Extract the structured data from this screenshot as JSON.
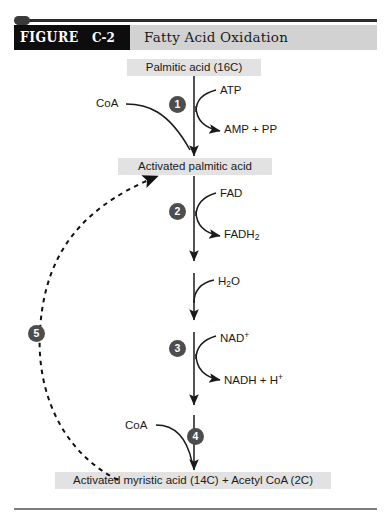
{
  "header": {
    "figure_word": "FIGURE",
    "figure_number": "C-2",
    "title": "Fatty Acid Oxidation"
  },
  "pathway": {
    "boxes": [
      {
        "id": "palmitic",
        "label": "Palmitic acid (16C)"
      },
      {
        "id": "activated",
        "label": "Activated palmitic acid"
      },
      {
        "id": "myristic",
        "label": "Activated myristic acid (14C) + Acetyl CoA (2C)"
      }
    ],
    "steps": [
      {
        "number": "1",
        "substrate": "CoA",
        "cosubstrate": "ATP",
        "product": "AMP + PP"
      },
      {
        "number": "2",
        "substrate": "",
        "cosubstrate": "FAD",
        "product": "FADH2"
      },
      {
        "number": "",
        "substrate": "",
        "cosubstrate": "H2O",
        "product": ""
      },
      {
        "number": "3",
        "substrate": "",
        "cosubstrate": "NAD+",
        "product": "NADH + H+"
      },
      {
        "number": "4",
        "substrate": "CoA",
        "cosubstrate": "",
        "product": ""
      },
      {
        "number": "5",
        "substrate": "",
        "cosubstrate": "",
        "product": ""
      }
    ],
    "labels": {
      "coa_step1": "CoA",
      "atp": "ATP",
      "amp_pp": "AMP + PP",
      "fad": "FAD",
      "fadh2_base": "FADH",
      "fadh2_sub": "2",
      "h2o_h": "H",
      "h2o_sub": "2",
      "h2o_o": "O",
      "nad_base": "NAD",
      "nad_sup": "+",
      "nadh_base": "NADH + H",
      "nadh_sup": "+",
      "coa_step4": "CoA"
    },
    "badges": {
      "one": "1",
      "two": "2",
      "three": "3",
      "four": "4",
      "five": "5"
    }
  },
  "colors": {
    "header_black": "#0d0d0d",
    "header_gray": "#d2d2d2",
    "box_gray": "#e2e2e2",
    "badge_gray": "#4d4d4d",
    "stroke": "#1a1a1a"
  }
}
